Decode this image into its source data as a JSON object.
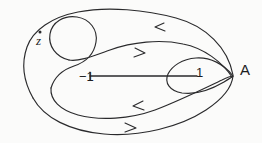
{
  "figure": {
    "background_color": "#fbfbfa",
    "ink_color": "#2a2a2c",
    "width": 262,
    "height": 143
  },
  "labels": {
    "point_z": "z",
    "branch_left": "−1",
    "branch_right": "1",
    "basepoint": "A"
  },
  "points": {
    "z_marker": {
      "name": "point-z-dot",
      "x": 40,
      "y": 32
    },
    "basepoint_A": {
      "x": 234,
      "y": 76
    }
  },
  "branch_cut": {
    "name": "branch-cut-segment",
    "from": -1,
    "to": 1,
    "x1": 90,
    "x2": 197,
    "y": 76
  },
  "arrows": [
    {
      "name": "arrow-top-outer",
      "direction": "left",
      "x": 157,
      "y": 27
    },
    {
      "name": "arrow-upper-middle",
      "direction": "right",
      "x": 142,
      "y": 53
    },
    {
      "name": "arrow-lower-middle",
      "direction": "left",
      "x": 135,
      "y": 106
    },
    {
      "name": "arrow-bottom-outer",
      "direction": "right",
      "x": 133,
      "y": 128
    }
  ],
  "curves": [
    {
      "name": "outer-contour",
      "description": "large closed loop from A sweeping left and back"
    },
    {
      "name": "inner-contour",
      "description": "inner loop passing near the branch cut"
    },
    {
      "name": "z-encircling-loop",
      "description": "small loop winding around the point z"
    },
    {
      "name": "figure-eight-crossing",
      "description": "self crossing near the point 1"
    }
  ]
}
